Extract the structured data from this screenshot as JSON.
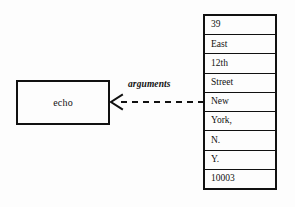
{
  "diagram": {
    "type": "uml-object-dependency",
    "process": {
      "label": "echo"
    },
    "dependency": {
      "label": "arguments",
      "style": "dashed",
      "arrowhead": "open-stick",
      "direction": "right-to-left",
      "from": "argument-list",
      "to": "echo"
    },
    "argument_list": {
      "name": "argument-list",
      "cells": [
        {
          "value": "39"
        },
        {
          "value": "East"
        },
        {
          "value": "12th"
        },
        {
          "value": "Street"
        },
        {
          "value": "New"
        },
        {
          "value": "York,"
        },
        {
          "value": "N."
        },
        {
          "value": "Y."
        },
        {
          "value": "10003"
        }
      ]
    },
    "colors": {
      "ink": "#111111",
      "paper": "#fdfdfd"
    }
  }
}
